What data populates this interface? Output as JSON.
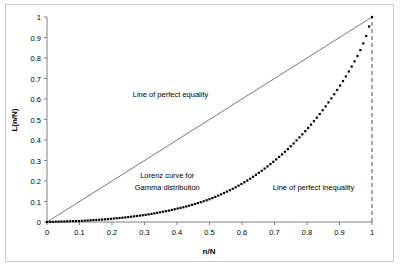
{
  "figure": {
    "background_color": "#ffffff",
    "frame_color": "#c9c9c9",
    "top_cut_text": ""
  },
  "chart_data": {
    "type": "line",
    "title": "",
    "xlabel": "n/N",
    "ylabel": "L(n/N)",
    "xlim": [
      0,
      1
    ],
    "ylim": [
      0,
      1
    ],
    "grid": false,
    "legend_position": "none",
    "xticks": [
      "0",
      "0.1",
      "0.2",
      "0.3",
      "0.4",
      "0.5",
      "0.6",
      "0.7",
      "0.8",
      "0.9",
      "1"
    ],
    "xtick_values": [
      0,
      0.1,
      0.2,
      0.3,
      0.4,
      0.5,
      0.6,
      0.7,
      0.8,
      0.9,
      1
    ],
    "yticks": [
      "0",
      "0.1",
      "0.2",
      "0.3",
      "0.4",
      "0.5",
      "0.6",
      "0.7",
      "0.8",
      "0.9",
      "1"
    ],
    "ytick_values": [
      0,
      0.1,
      0.2,
      0.3,
      0.4,
      0.5,
      0.6,
      0.7,
      0.8,
      0.9,
      1
    ],
    "series": [
      {
        "name": "Line of perfect equality",
        "style": "solid-thin",
        "color": "#555555",
        "x": [
          0,
          1
        ],
        "values": [
          0,
          1
        ]
      },
      {
        "name": "Lorenz curve for Gamma distribution",
        "style": "dotted-markers",
        "color": "#000000",
        "x": [
          0,
          0.02,
          0.04,
          0.06,
          0.08,
          0.1,
          0.12,
          0.14,
          0.16,
          0.18,
          0.2,
          0.22,
          0.24,
          0.26,
          0.28,
          0.3,
          0.32,
          0.34,
          0.36,
          0.38,
          0.4,
          0.42,
          0.44,
          0.46,
          0.48,
          0.5,
          0.52,
          0.54,
          0.56,
          0.58,
          0.6,
          0.62,
          0.64,
          0.66,
          0.68,
          0.7,
          0.72,
          0.74,
          0.76,
          0.78,
          0.8,
          0.82,
          0.84,
          0.86,
          0.88,
          0.9,
          0.92,
          0.94,
          0.96,
          0.98,
          1
        ],
        "values": [
          0,
          0.001,
          0.002,
          0.003,
          0.004,
          0.005,
          0.007,
          0.009,
          0.011,
          0.013,
          0.016,
          0.019,
          0.022,
          0.026,
          0.03,
          0.034,
          0.039,
          0.045,
          0.051,
          0.057,
          0.065,
          0.072,
          0.081,
          0.09,
          0.1,
          0.111,
          0.124,
          0.138,
          0.153,
          0.169,
          0.187,
          0.206,
          0.227,
          0.249,
          0.273,
          0.298,
          0.325,
          0.354,
          0.385,
          0.418,
          0.452,
          0.489,
          0.528,
          0.57,
          0.614,
          0.661,
          0.711,
          0.765,
          0.823,
          0.896,
          1
        ]
      },
      {
        "name": "Line of perfect inequality",
        "style": "dashed-vertical",
        "color": "#555555",
        "x": [
          1,
          1
        ],
        "values": [
          0,
          1
        ]
      }
    ],
    "annotations": [
      {
        "id": "equality-annotation",
        "text": "Line of perfect equality",
        "x": 0.38,
        "y": 0.61
      },
      {
        "id": "lorenz-annotation-line1",
        "text": "Lorenz curve for",
        "x": 0.37,
        "y": 0.215
      },
      {
        "id": "lorenz-annotation-line2",
        "text": "Gamma distribution",
        "x": 0.37,
        "y": 0.155
      },
      {
        "id": "inequality-annotation",
        "text": "Line of perfect inequality",
        "x": 0.82,
        "y": 0.155
      }
    ]
  }
}
